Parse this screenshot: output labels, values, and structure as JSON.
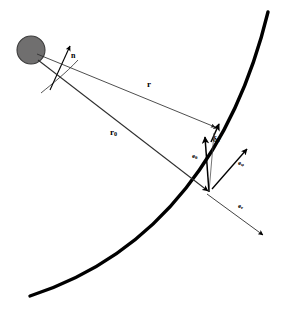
{
  "figure": {
    "type": "vector-geometry-diagram",
    "background_color": "#ffffff",
    "stroke_color": "#000000",
    "thin_stroke_color": "#333333"
  },
  "source": {
    "name": "source-sphere",
    "description": "gray filled circle representing the source point",
    "center_x": 31,
    "center_y": 50,
    "radius": 14,
    "fill_color": "#706f6f",
    "stroke_color": "#3a3a3a"
  },
  "surface": {
    "name": "curved-surface",
    "description": "thick arc representing the scattering surface",
    "stroke_width": 3.2,
    "color": "#000000"
  },
  "vectors": [
    {
      "id": "n",
      "label": "n",
      "subscript": "",
      "description": "surface normal / reference direction arrow near source",
      "from_x": 50,
      "from_y": 88,
      "to_x": 70,
      "to_y": 46
    },
    {
      "id": "r",
      "label": "r",
      "subscript": "",
      "description": "vector from source to the perturbed field point",
      "from_x": 36,
      "from_y": 54,
      "to_x": 216,
      "to_y": 128
    },
    {
      "id": "r0",
      "label": "r",
      "subscript": "0",
      "description": "vector from source to the surface point",
      "from_x": 37,
      "from_y": 59,
      "to_x": 209,
      "to_y": 192
    },
    {
      "id": "dr",
      "label": "δr",
      "subscript": "",
      "description": "small displacement vector at the field point",
      "from_x": 211,
      "from_y": 141,
      "to_x": 219,
      "to_y": 125
    },
    {
      "id": "e_theta",
      "label": "e",
      "subscript": "θ",
      "description": "polar unit vector, tangent to surface pointing up",
      "from_x": 209,
      "from_y": 192,
      "to_x": 205,
      "to_y": 138
    },
    {
      "id": "e_phi",
      "label": "e",
      "subscript": "φ",
      "description": "azimuthal unit vector, tangent to surface pointing up-right",
      "from_x": 209,
      "from_y": 192,
      "to_x": 247,
      "to_y": 150
    },
    {
      "id": "e_r",
      "label": "e",
      "subscript": "r",
      "description": "radial unit vector, normal to surface pointing down-right",
      "from_x": 209,
      "from_y": 192,
      "to_x": 263,
      "to_y": 234
    }
  ],
  "arc": {
    "name": "angle-arc",
    "description": "thin arc spanning the angle between the n direction and the r rays"
  },
  "labels": {
    "n": "n",
    "r": "r",
    "r0_base": "r",
    "r0_sub": "0",
    "delta_r": "δr",
    "e_theta_base": "e",
    "e_theta_sub": "θ",
    "e_phi_base": "e",
    "e_phi_sub": "φ",
    "e_r_base": "e",
    "e_r_sub": "r"
  }
}
